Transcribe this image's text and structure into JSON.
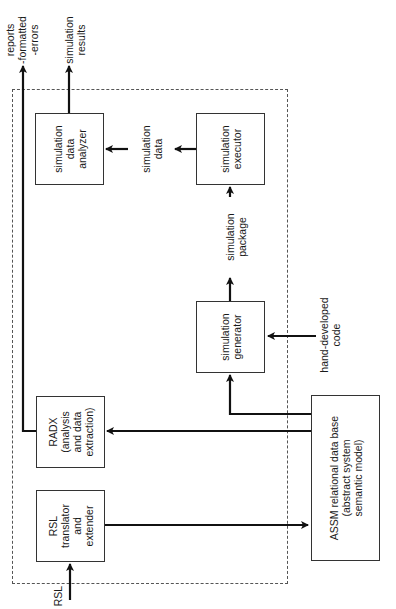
{
  "diagram": {
    "boundary": "dashed-system-boundary",
    "nodes": {
      "sim_analyzer": {
        "label": "simulation\ndata\nanalyzer"
      },
      "sim_executor": {
        "label": "simulation\nexecutor"
      },
      "sim_generator": {
        "label": "simulation\ngenerator"
      },
      "radx": {
        "label": "RADX\n(analysis\nand data\nextraction)"
      },
      "rsl_translator": {
        "label": "RSL\ntranslator\nand\nextender"
      },
      "assm": {
        "label": "ASSM relational data base\n(abstract system\nsemantic model)"
      }
    },
    "edge_labels": {
      "reports": "reports\n-formatted\n-errors",
      "sim_results": "simulation\nresults",
      "sim_data": "simulation\ndata",
      "sim_package": "simulation\npackage",
      "hand_code": "hand-developed\ncode",
      "rsl_input": "RSL"
    },
    "edges": [
      {
        "from": "rsl_input",
        "to": "rsl_translator"
      },
      {
        "from": "rsl_translator",
        "to": "assm"
      },
      {
        "from": "assm",
        "to": "radx"
      },
      {
        "from": "assm",
        "to": "sim_generator"
      },
      {
        "from": "hand_code",
        "to": "sim_generator"
      },
      {
        "from": "sim_generator",
        "to": "sim_executor",
        "label": "simulation package"
      },
      {
        "from": "sim_executor",
        "to": "sim_analyzer",
        "label": "simulation data"
      },
      {
        "from": "sim_analyzer",
        "to": "output",
        "label": "simulation results"
      },
      {
        "from": "radx",
        "to": "output",
        "label": "reports -formatted -errors"
      }
    ]
  }
}
